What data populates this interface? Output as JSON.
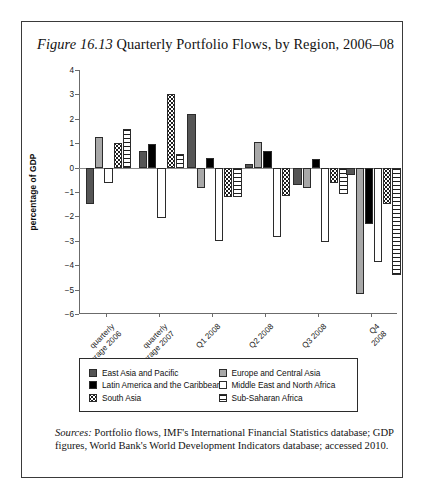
{
  "figure": {
    "number_label": "Figure 16.13",
    "title": "Quarterly Portfolio Flows, by Region, 2006–08"
  },
  "source_note": {
    "label": "Sources:",
    "text": " Portfolio flows, IMF's International Financial Statistics database; GDP figures, World Bank's World Development Indicators database; accessed 2010."
  },
  "chart_data": {
    "type": "bar",
    "title": "Quarterly Portfolio Flows, by Region, 2006–08",
    "xlabel": "",
    "ylabel": "percentage of GDP",
    "ylim": [
      -6,
      4
    ],
    "yticks": [
      4,
      3,
      2,
      1,
      0,
      -1,
      -2,
      -3,
      -4,
      -5,
      -6
    ],
    "ytick_labels": [
      "4",
      "3",
      "2",
      "1",
      "0",
      "−1",
      "−2",
      "−3",
      "−4",
      "−5",
      "−6"
    ],
    "grid": false,
    "legend_position": "below",
    "categories": [
      "quarterly\naverage 2006",
      "quarterly\naverage 2007",
      "Q1 2008",
      "Q2 2008",
      "Q3 2008",
      "Q4 2008"
    ],
    "series": [
      {
        "name": "East Asia and Pacific",
        "pattern": "solid-dark-gray",
        "color": "#555555",
        "values": [
          -1.5,
          0.7,
          2.2,
          0.15,
          -0.7,
          -0.3
        ]
      },
      {
        "name": "Europe and Central Asia",
        "pattern": "solid-light-gray",
        "color": "#a8a8a8",
        "values": [
          1.25,
          null,
          -0.85,
          1.05,
          -0.85,
          -5.2
        ]
      },
      {
        "name": "Latin America and the Caribbean",
        "pattern": "solid-black",
        "color": "#000000",
        "values": [
          null,
          0.95,
          0.4,
          0.7,
          0.35,
          -2.3
        ]
      },
      {
        "name": "Middle East and North Africa",
        "pattern": "white",
        "color": "#ffffff",
        "values": [
          -0.65,
          -2.05,
          -3.0,
          -2.85,
          -3.05,
          -3.85
        ]
      },
      {
        "name": "South Asia",
        "pattern": "dotted",
        "color": "#ffffff",
        "values": [
          1.0,
          3.0,
          -1.2,
          -1.15,
          -0.65,
          -1.5
        ]
      },
      {
        "name": "Sub-Saharan Africa",
        "pattern": "horizontal-stripe",
        "color": "#ffffff",
        "values": [
          1.6,
          0.55,
          -1.2,
          null,
          -1.1,
          -4.4
        ]
      }
    ]
  }
}
